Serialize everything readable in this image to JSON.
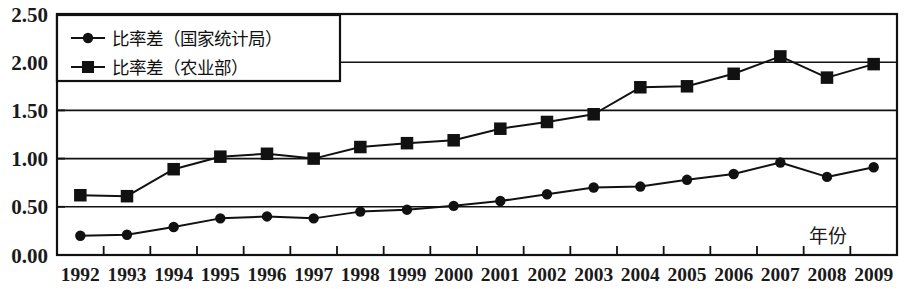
{
  "chart_data": {
    "type": "line",
    "title": "",
    "xlabel": "年份",
    "ylabel": "",
    "categories": [
      1992,
      1993,
      1994,
      1995,
      1996,
      1997,
      1998,
      1999,
      2000,
      2001,
      2002,
      2003,
      2004,
      2005,
      2006,
      2007,
      2008,
      2009
    ],
    "xtick_labels": [
      "1992",
      "1993",
      "1994",
      "1995",
      "1996",
      "1997",
      "1998",
      "1999",
      "2000",
      "2001",
      "2002",
      "2003",
      "2004",
      "2005",
      "2006",
      "2007",
      "2008",
      "2009"
    ],
    "ytick_labels": [
      "0.00",
      "0.50",
      "1.00",
      "1.50",
      "2.00",
      "2.50"
    ],
    "ytick_values": [
      0.0,
      0.5,
      1.0,
      1.5,
      2.0,
      2.5
    ],
    "ylim": [
      0.0,
      2.5
    ],
    "grid": "horizontal",
    "legend_position": "top-left",
    "series": [
      {
        "name": "比率差（国家统计局）",
        "marker": "circle",
        "color": "#111111",
        "values": [
          0.2,
          0.21,
          0.29,
          0.38,
          0.4,
          0.38,
          0.45,
          0.47,
          0.51,
          0.56,
          0.63,
          0.7,
          0.71,
          0.78,
          0.84,
          0.96,
          0.81,
          0.91
        ]
      },
      {
        "name": "比率差（农业部）",
        "marker": "square",
        "color": "#111111",
        "values": [
          0.62,
          0.61,
          0.89,
          1.02,
          1.05,
          1.0,
          1.12,
          1.16,
          1.19,
          1.31,
          1.38,
          1.46,
          1.74,
          1.75,
          1.88,
          2.06,
          1.84,
          1.98
        ]
      }
    ]
  },
  "legend": {
    "entries": [
      {
        "label": "比率差（国家统计局）",
        "marker": "circle"
      },
      {
        "label": "比率差（农业部）",
        "marker": "square"
      }
    ]
  },
  "axis": {
    "x_axis_title": "年份"
  }
}
